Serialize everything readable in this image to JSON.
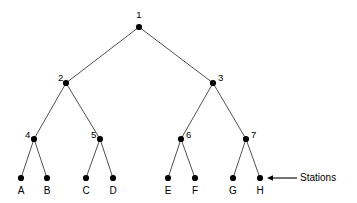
{
  "diagram": {
    "type": "binary-tree",
    "title": "",
    "background_color": "#ffffff",
    "edge_color": "#3d3d3d",
    "node_color": "#000000",
    "internal_nodes": [
      {
        "id": "n1",
        "label": "1",
        "x": 139,
        "y": 27,
        "label_x": 139,
        "label_y": 10,
        "label_pos": "above"
      },
      {
        "id": "n2",
        "label": "2",
        "x": 66,
        "y": 83,
        "label_x": 58,
        "label_y": 73,
        "label_pos": "left"
      },
      {
        "id": "n3",
        "label": "3",
        "x": 213,
        "y": 83,
        "label_x": 218,
        "label_y": 73,
        "label_pos": "right"
      },
      {
        "id": "n4",
        "label": "4",
        "x": 34,
        "y": 139,
        "label_x": 25,
        "label_y": 130,
        "label_pos": "left"
      },
      {
        "id": "n5",
        "label": "5",
        "x": 100,
        "y": 139,
        "label_x": 91,
        "label_y": 130,
        "label_pos": "left"
      },
      {
        "id": "n6",
        "label": "6",
        "x": 181,
        "y": 139,
        "label_x": 186,
        "label_y": 130,
        "label_pos": "right"
      },
      {
        "id": "n7",
        "label": "7",
        "x": 246,
        "y": 139,
        "label_x": 251,
        "label_y": 130,
        "label_pos": "right"
      }
    ],
    "leaf_nodes": [
      {
        "id": "lA",
        "label": "A",
        "x": 21,
        "y": 178,
        "label_x": 21,
        "label_y": 186
      },
      {
        "id": "lB",
        "label": "B",
        "x": 47,
        "y": 178,
        "label_x": 47,
        "label_y": 186
      },
      {
        "id": "lC",
        "label": "C",
        "x": 86,
        "y": 178,
        "label_x": 86,
        "label_y": 186
      },
      {
        "id": "lD",
        "label": "D",
        "x": 113,
        "y": 178,
        "label_x": 113,
        "label_y": 186
      },
      {
        "id": "lE",
        "label": "E",
        "x": 168,
        "y": 178,
        "label_x": 168,
        "label_y": 186
      },
      {
        "id": "lF",
        "label": "F",
        "x": 195,
        "y": 178,
        "label_x": 195,
        "label_y": 186
      },
      {
        "id": "lG",
        "label": "G",
        "x": 233,
        "y": 178,
        "label_x": 233,
        "label_y": 186
      },
      {
        "id": "lH",
        "label": "H",
        "x": 260,
        "y": 178,
        "label_x": 260,
        "label_y": 186
      }
    ],
    "edges": [
      {
        "from": "n1",
        "to": "n2",
        "x1": 139,
        "y1": 27,
        "x2": 66,
        "y2": 83
      },
      {
        "from": "n1",
        "to": "n3",
        "x1": 139,
        "y1": 27,
        "x2": 213,
        "y2": 83
      },
      {
        "from": "n2",
        "to": "n4",
        "x1": 66,
        "y1": 83,
        "x2": 34,
        "y2": 139
      },
      {
        "from": "n2",
        "to": "n5",
        "x1": 66,
        "y1": 83,
        "x2": 100,
        "y2": 139
      },
      {
        "from": "n3",
        "to": "n6",
        "x1": 213,
        "y1": 83,
        "x2": 181,
        "y2": 139
      },
      {
        "from": "n3",
        "to": "n7",
        "x1": 213,
        "y1": 83,
        "x2": 246,
        "y2": 139
      },
      {
        "from": "n4",
        "to": "lA",
        "x1": 34,
        "y1": 139,
        "x2": 21,
        "y2": 178
      },
      {
        "from": "n4",
        "to": "lB",
        "x1": 34,
        "y1": 139,
        "x2": 47,
        "y2": 178
      },
      {
        "from": "n5",
        "to": "lC",
        "x1": 100,
        "y1": 139,
        "x2": 86,
        "y2": 178
      },
      {
        "from": "n5",
        "to": "lD",
        "x1": 100,
        "y1": 139,
        "x2": 113,
        "y2": 178
      },
      {
        "from": "n6",
        "to": "lE",
        "x1": 181,
        "y1": 139,
        "x2": 168,
        "y2": 178
      },
      {
        "from": "n6",
        "to": "lF",
        "x1": 181,
        "y1": 139,
        "x2": 195,
        "y2": 178
      },
      {
        "from": "n7",
        "to": "lG",
        "x1": 246,
        "y1": 139,
        "x2": 233,
        "y2": 178
      },
      {
        "from": "n7",
        "to": "lH",
        "x1": 246,
        "y1": 139,
        "x2": 260,
        "y2": 178
      }
    ],
    "annotation": {
      "text": "Stations",
      "points_to": "lH",
      "arrow_tip_x": 267,
      "arrow_tail_x": 297,
      "arrow_y": 178,
      "text_x": 300,
      "text_y": 173
    }
  }
}
